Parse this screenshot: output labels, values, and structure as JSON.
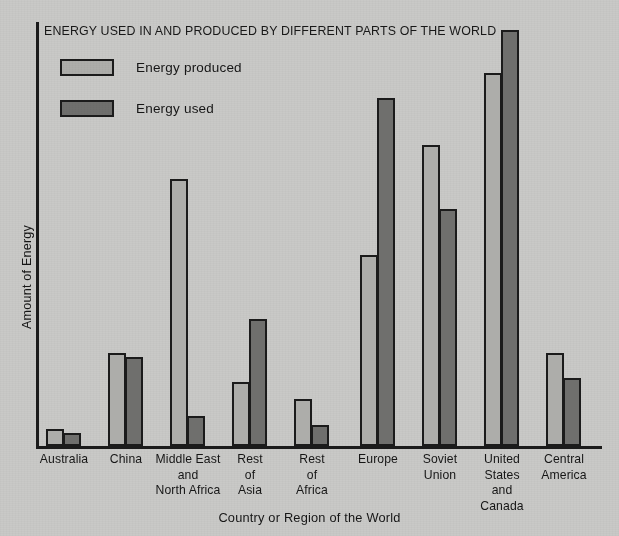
{
  "chart_data": {
    "type": "bar",
    "title": "ENERGY USED IN AND PRODUCED BY DIFFERENT PARTS OF THE WORLD",
    "xlabel": "Country or Region of the World",
    "ylabel": "Amount of Energy",
    "grid": false,
    "legend_position": "top-left",
    "ylim": [
      0,
      100
    ],
    "y_tick_labels": [],
    "categories": [
      "Australia",
      "China",
      "Middle East and North Africa",
      "Rest of Asia",
      "Rest of Africa",
      "Europe",
      "Soviet Union",
      "United States and Canada",
      "Central America"
    ],
    "category_label_lines": [
      [
        "Australia"
      ],
      [
        "China"
      ],
      [
        "Middle East",
        "and",
        "North Africa"
      ],
      [
        "Rest",
        "of",
        "Asia"
      ],
      [
        "Rest",
        "of",
        "Africa"
      ],
      [
        "Europe"
      ],
      [
        "Soviet",
        "Union"
      ],
      [
        "United",
        "States",
        "and",
        "Canada"
      ],
      [
        "Central",
        "America"
      ]
    ],
    "series": [
      {
        "name": "Energy produced",
        "color": "#adadaa",
        "values": [
          4,
          22,
          63,
          15,
          11,
          45,
          71,
          88,
          22
        ]
      },
      {
        "name": "Energy used",
        "color": "#6f6f6d",
        "values": [
          3,
          21,
          7,
          30,
          5,
          82,
          56,
          98,
          16
        ]
      }
    ]
  },
  "legend": {
    "items": [
      {
        "label": "Energy produced",
        "swatch": "light-gray"
      },
      {
        "label": "Energy used",
        "swatch": "dark-gray"
      }
    ]
  },
  "colors": {
    "background": "#c9c9c7",
    "ink": "#1b1b1b",
    "produced": "#adadaa",
    "used": "#6f6f6d"
  }
}
